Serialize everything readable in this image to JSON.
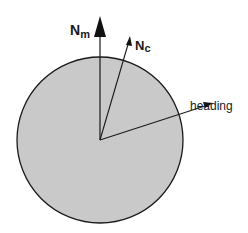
{
  "diagram": {
    "circle": {
      "cx": 100,
      "cy": 140,
      "r": 83,
      "fill": "#c9c9c9",
      "stroke": "#1a1a1a"
    },
    "vectors": [
      {
        "id": "magnetic-north",
        "label": "N",
        "subscript": "m",
        "tip": [
          100,
          17
        ]
      },
      {
        "id": "compass-north",
        "label": "N",
        "subscript": "c",
        "tip": [
          130,
          37
        ]
      },
      {
        "id": "heading",
        "label": "heading",
        "tip": [
          212,
          103
        ]
      }
    ]
  }
}
